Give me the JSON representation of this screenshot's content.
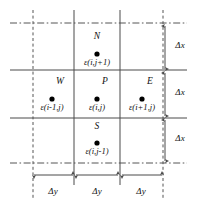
{
  "figure": {
    "colors": {
      "line": "#4a4a4a",
      "dashed": "#555555",
      "text": "#111111",
      "dot": "#000000",
      "background": "#ffffff"
    },
    "nodes": [
      {
        "id": "north",
        "letter": "N",
        "expr": "ε(i,j+1)",
        "dot_x": 97,
        "dot_y": 54,
        "letter_x": 97,
        "letter_y": 38,
        "expr_x": 97,
        "expr_y": 61
      },
      {
        "id": "west",
        "letter": "W",
        "expr": "ε(i-1,j)",
        "dot_x": 52,
        "dot_y": 99,
        "letter_x": 59,
        "letter_y": 83,
        "expr_x": 52,
        "expr_y": 106
      },
      {
        "id": "center",
        "letter": "P",
        "expr": "ε(i,j)",
        "dot_x": 97,
        "dot_y": 99,
        "letter_x": 104,
        "letter_y": 83,
        "expr_x": 97,
        "expr_y": 106
      },
      {
        "id": "east",
        "letter": "E",
        "expr": "ε(i+1,j)",
        "dot_x": 142,
        "dot_y": 99,
        "letter_x": 149,
        "letter_y": 83,
        "expr_x": 142,
        "expr_y": 106
      },
      {
        "id": "south",
        "letter": "S",
        "expr": "ε(i,j-1)",
        "dot_x": 97,
        "dot_y": 143,
        "letter_x": 97,
        "letter_y": 128,
        "expr_x": 97,
        "expr_y": 150
      }
    ],
    "vertical_dimensions": [
      {
        "id": "dx-top",
        "label": "Δx",
        "label_x": 180,
        "label_y": 44,
        "y_start": 25,
        "y_end": 70
      },
      {
        "id": "dx-middle",
        "label": "Δx",
        "label_x": 180,
        "label_y": 90,
        "y_start": 71,
        "y_end": 117
      },
      {
        "id": "dx-bottom",
        "label": "Δx",
        "label_x": 180,
        "label_y": 136,
        "y_start": 118,
        "y_end": 162
      }
    ],
    "horizontal_dimensions": [
      {
        "id": "dy-left",
        "label": "Δy",
        "label_x": 53,
        "label_y": 191,
        "x_start": 33,
        "x_end": 74
      },
      {
        "id": "dy-center",
        "label": "Δy",
        "label_x": 97,
        "label_y": 191,
        "x_start": 75,
        "x_end": 119
      },
      {
        "id": "dy-right",
        "label": "Δy",
        "label_x": 141,
        "label_y": 191,
        "x_start": 120,
        "x_end": 163
      }
    ],
    "grid": {
      "solid_horizontals_y": [
        70,
        118
      ],
      "solid_verticals_x": [
        74,
        120
      ],
      "dashdot_horizontals_y": [
        23,
        163
      ],
      "dashed_verticals_x": [
        33,
        163
      ],
      "dim_line_x": 165,
      "dim_line_y": 175
    }
  }
}
